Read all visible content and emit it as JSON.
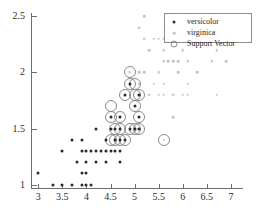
{
  "chart_data": {
    "type": "scatter",
    "title": "",
    "xlabel": "",
    "ylabel": "",
    "xlim": [
      2.85,
      7.25
    ],
    "ylim": [
      0.97,
      2.53
    ],
    "grid": false,
    "xticks": [
      3,
      3.5,
      4,
      4.5,
      5,
      5.5,
      6,
      6.5,
      7
    ],
    "xtick_labels": [
      "3",
      "3.5",
      "4",
      "4.5",
      "5",
      "5.5",
      "6",
      "6.5",
      "7"
    ],
    "yticks": [
      1,
      1.5,
      2,
      2.5
    ],
    "ytick_labels": [
      "1",
      "1.5",
      "2",
      "2.5"
    ],
    "legend_position": "upper right",
    "series": [
      {
        "name": "versicolor",
        "marker": "filled-dot",
        "color": "#2a2a2a",
        "points": [
          [
            3.0,
            1.1
          ],
          [
            3.3,
            1.0
          ],
          [
            3.5,
            1.0
          ],
          [
            3.7,
            1.0
          ],
          [
            3.9,
            1.0
          ],
          [
            4.0,
            1.0
          ],
          [
            4.1,
            1.0
          ],
          [
            3.9,
            1.1
          ],
          [
            4.0,
            1.1
          ],
          [
            3.8,
            1.2
          ],
          [
            4.0,
            1.2
          ],
          [
            4.2,
            1.2
          ],
          [
            4.4,
            1.2
          ],
          [
            4.7,
            1.2
          ],
          [
            3.5,
            1.3
          ],
          [
            3.9,
            1.3
          ],
          [
            4.0,
            1.3
          ],
          [
            4.1,
            1.3
          ],
          [
            4.2,
            1.3
          ],
          [
            4.3,
            1.3
          ],
          [
            4.4,
            1.3
          ],
          [
            4.5,
            1.3
          ],
          [
            4.6,
            1.3
          ],
          [
            4.7,
            1.3
          ],
          [
            3.7,
            1.4
          ],
          [
            3.9,
            1.4
          ],
          [
            4.4,
            1.4
          ],
          [
            4.6,
            1.4
          ],
          [
            4.7,
            1.4
          ],
          [
            4.8,
            1.4
          ],
          [
            4.2,
            1.5
          ],
          [
            4.5,
            1.5
          ],
          [
            4.6,
            1.5
          ],
          [
            4.7,
            1.5
          ],
          [
            4.9,
            1.5
          ],
          [
            5.0,
            1.5
          ],
          [
            5.1,
            1.5
          ],
          [
            4.5,
            1.6
          ],
          [
            4.7,
            1.6
          ],
          [
            5.1,
            1.6
          ],
          [
            5.0,
            1.7
          ],
          [
            4.8,
            1.8
          ],
          [
            5.1,
            1.8
          ],
          [
            4.9,
            1.9
          ]
        ]
      },
      {
        "name": "virginica",
        "marker": "light-dot",
        "color": "#c2c2c2",
        "points": [
          [
            5.6,
            1.4
          ],
          [
            5.8,
            1.6
          ],
          [
            5.0,
            1.5
          ],
          [
            5.1,
            1.5
          ],
          [
            5.1,
            1.8
          ],
          [
            5.3,
            1.8
          ],
          [
            5.5,
            1.8
          ],
          [
            5.6,
            1.8
          ],
          [
            5.8,
            1.8
          ],
          [
            6.1,
            1.8
          ],
          [
            6.7,
            1.8
          ],
          [
            6.0,
            1.8
          ],
          [
            5.1,
            1.9
          ],
          [
            5.4,
            1.9
          ],
          [
            5.6,
            1.9
          ],
          [
            6.1,
            1.9
          ],
          [
            4.9,
            2.0
          ],
          [
            5.1,
            2.0
          ],
          [
            5.2,
            2.0
          ],
          [
            5.5,
            2.0
          ],
          [
            5.9,
            2.0
          ],
          [
            6.3,
            2.0
          ],
          [
            5.6,
            2.1
          ],
          [
            5.7,
            2.1
          ],
          [
            5.8,
            2.1
          ],
          [
            5.9,
            2.1
          ],
          [
            6.1,
            2.1
          ],
          [
            6.6,
            2.1
          ],
          [
            6.9,
            2.1
          ],
          [
            5.3,
            2.2
          ],
          [
            5.6,
            2.2
          ],
          [
            6.0,
            2.2
          ],
          [
            6.7,
            2.2
          ],
          [
            5.2,
            2.3
          ],
          [
            5.4,
            2.3
          ],
          [
            5.5,
            2.3
          ],
          [
            5.6,
            2.3
          ],
          [
            5.7,
            2.3
          ],
          [
            5.9,
            2.3
          ],
          [
            6.1,
            2.3
          ],
          [
            6.9,
            2.3
          ],
          [
            5.1,
            2.4
          ],
          [
            5.7,
            2.4
          ],
          [
            6.1,
            2.4
          ],
          [
            5.2,
            2.5
          ],
          [
            5.8,
            2.5
          ],
          [
            6.1,
            2.5
          ],
          [
            6.6,
            2.5
          ]
        ]
      }
    ],
    "support_vectors": {
      "name": "Support Vector",
      "marker": "open-circle",
      "color": "#8a8a8a",
      "points": [
        [
          4.5,
          1.4
        ],
        [
          4.6,
          1.4
        ],
        [
          4.7,
          1.4
        ],
        [
          4.8,
          1.4
        ],
        [
          4.6,
          1.5
        ],
        [
          4.7,
          1.5
        ],
        [
          4.9,
          1.5
        ],
        [
          5.0,
          1.5
        ],
        [
          5.1,
          1.5
        ],
        [
          4.5,
          1.6
        ],
        [
          4.7,
          1.6
        ],
        [
          5.1,
          1.6
        ],
        [
          4.5,
          1.7
        ],
        [
          5.0,
          1.7
        ],
        [
          4.8,
          1.8
        ],
        [
          5.0,
          1.8
        ],
        [
          5.1,
          1.8
        ],
        [
          4.9,
          1.9
        ],
        [
          5.0,
          1.9
        ],
        [
          4.9,
          2.0
        ],
        [
          5.6,
          1.4
        ]
      ]
    },
    "legend": [
      {
        "label": "versicolor",
        "marker": "filled-dot"
      },
      {
        "label": "virginica",
        "marker": "light-dot"
      },
      {
        "label": "Support Vector",
        "marker": "open-circle"
      }
    ]
  }
}
